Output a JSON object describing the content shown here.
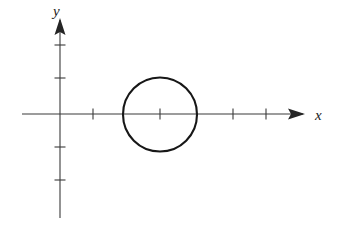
{
  "figure": {
    "background_color": "#ffffff",
    "axis_color": "#3a3a3a",
    "curve_color": "#171717",
    "width": 341,
    "height": 238,
    "x_axis_label": "x",
    "y_axis_label": "y"
  },
  "chart_data": {
    "type": "scatter",
    "title": "",
    "subtitle": "",
    "xlabel": "x",
    "ylabel": "y",
    "grid": false,
    "legend": null,
    "axes_style": "arrowed-cartesian",
    "origin_px": {
      "x": 60,
      "y": 114
    },
    "unit_px": 33.5,
    "xlim": [
      -1.15,
      7.3
    ],
    "ylim": [
      -3.1,
      2.9
    ],
    "x_axis_px": {
      "start": 22,
      "end": 305,
      "y": 114,
      "arrow_at": "end"
    },
    "y_axis_px": {
      "start": 18,
      "end": 218,
      "x": 60,
      "arrow_at": "start"
    },
    "x_ticks": [
      1,
      2,
      3,
      4,
      5,
      6
    ],
    "x_ticks_px": [
      93,
      127,
      160,
      194,
      233,
      266
    ],
    "x_ticks_hidden_by_curve": [
      127,
      194
    ],
    "y_ticks": [
      1,
      2,
      -1,
      -2
    ],
    "y_ticks_px": [
      78,
      45,
      147,
      180
    ],
    "tick_length_px": 11,
    "tick_labels_shown": false,
    "series": [
      {
        "name": "circle",
        "type": "circle",
        "center": [
          3,
          0
        ],
        "radius": 1.1,
        "center_px": [
          160,
          114.5
        ],
        "radius_px": 37,
        "equation": "(x - 3)^2 + y^2 = r^2",
        "filled": false,
        "stroke_width_px": 2.1
      }
    ],
    "annotations": []
  }
}
